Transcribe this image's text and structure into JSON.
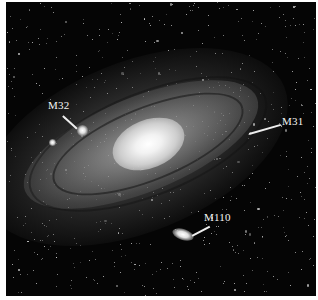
{
  "image": {
    "subject": "Andromeda Galaxy with satellite galaxies",
    "palette": {
      "background": "#050505",
      "border": "#ffffff",
      "label_color": "#f4f4f4"
    }
  },
  "labels": [
    {
      "id": "m32",
      "text": "M32"
    },
    {
      "id": "m31",
      "text": "M31"
    },
    {
      "id": "m110",
      "text": "M110"
    }
  ]
}
